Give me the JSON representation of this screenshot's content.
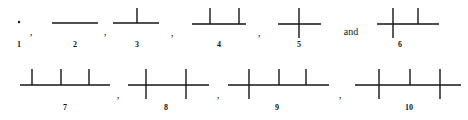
{
  "figure": {
    "caption": "",
    "stroke_color": "#151515",
    "background_color": "#ffffff",
    "width": 468,
    "height": 120
  },
  "diagram_items": [
    {
      "id": "figure-1",
      "label": "1",
      "label_x": 19,
      "label_y": 41,
      "kind": "point",
      "baseline_y": 23,
      "baseline_x1": 18,
      "baseline_x2": 20,
      "nodes": [],
      "dot": {
        "cx": 19,
        "cy": 22,
        "r": 1.2
      }
    },
    {
      "id": "figure-2",
      "label": "2",
      "label_x": 75,
      "label_y": 41,
      "kind": "segment",
      "baseline_y": 23,
      "baseline_x1": 52,
      "baseline_x2": 98,
      "nodes": []
    },
    {
      "id": "figure-3",
      "label": "3",
      "label_x": 137,
      "label_y": 41,
      "kind": "segment-with-ticks",
      "baseline_y": 23,
      "baseline_x1": 113,
      "baseline_x2": 159,
      "nodes": [
        {
          "x": 137,
          "up": 15,
          "down": 0
        }
      ]
    },
    {
      "id": "figure-4",
      "label": "4",
      "label_x": 219,
      "label_y": 41,
      "kind": "segment-with-ticks",
      "baseline_y": 24,
      "baseline_x1": 192,
      "baseline_x2": 246,
      "nodes": [
        {
          "x": 210,
          "up": 16,
          "down": 0
        },
        {
          "x": 239,
          "up": 16,
          "down": 0
        }
      ]
    },
    {
      "id": "figure-5",
      "label": "5",
      "label_x": 299,
      "label_y": 41,
      "kind": "segment-with-ticks",
      "baseline_y": 24,
      "baseline_x1": 278,
      "baseline_x2": 321,
      "nodes": [
        {
          "x": 299,
          "up": 16,
          "down": 14
        }
      ]
    },
    {
      "id": "figure-6",
      "label": "6",
      "label_x": 400,
      "label_y": 41,
      "kind": "segment-with-ticks",
      "baseline_y": 24,
      "baseline_x1": 377,
      "baseline_x2": 439,
      "nodes": [
        {
          "x": 393,
          "up": 16,
          "down": 14
        },
        {
          "x": 418,
          "up": 16,
          "down": 0
        }
      ]
    },
    {
      "id": "figure-7",
      "label": "7",
      "label_x": 65,
      "label_y": 104,
      "kind": "segment-with-ticks",
      "baseline_y": 85,
      "baseline_x1": 20,
      "baseline_x2": 110,
      "nodes": [
        {
          "x": 32,
          "up": 16,
          "down": 0
        },
        {
          "x": 61,
          "up": 16,
          "down": 0
        },
        {
          "x": 89,
          "up": 16,
          "down": 0
        }
      ]
    },
    {
      "id": "figure-8",
      "label": "8",
      "label_x": 166,
      "label_y": 104,
      "kind": "segment-with-ticks",
      "baseline_y": 85,
      "baseline_x1": 128,
      "baseline_x2": 209,
      "nodes": [
        {
          "x": 146,
          "up": 16,
          "down": 14
        },
        {
          "x": 186,
          "up": 16,
          "down": 14
        }
      ]
    },
    {
      "id": "figure-9",
      "label": "9",
      "label_x": 277,
      "label_y": 104,
      "kind": "segment-with-ticks",
      "baseline_y": 85,
      "baseline_x1": 228,
      "baseline_x2": 329,
      "nodes": [
        {
          "x": 249,
          "up": 16,
          "down": 14
        },
        {
          "x": 279,
          "up": 16,
          "down": 0
        },
        {
          "x": 306,
          "up": 16,
          "down": 0
        }
      ]
    },
    {
      "id": "figure-10",
      "label": "10",
      "label_x": 409,
      "label_y": 104,
      "kind": "segment-with-ticks",
      "baseline_y": 85,
      "baseline_x1": 355,
      "baseline_x2": 461,
      "nodes": [
        {
          "x": 379,
          "up": 16,
          "down": 14
        },
        {
          "x": 410,
          "up": 16,
          "down": 0
        },
        {
          "x": 440,
          "up": 16,
          "down": 14
        }
      ]
    }
  ],
  "separators": [
    {
      "id": "sep-1-2",
      "text": ",",
      "x": 31,
      "y": 26
    },
    {
      "id": "sep-2-3",
      "text": ",",
      "x": 105,
      "y": 26
    },
    {
      "id": "sep-3-4",
      "text": ",",
      "x": 172,
      "y": 27
    },
    {
      "id": "sep-4-5",
      "text": ",",
      "x": 259,
      "y": 27
    },
    {
      "id": "sep-7-8",
      "text": ",",
      "x": 118,
      "y": 89
    },
    {
      "id": "sep-8-9",
      "text": ",",
      "x": 218,
      "y": 89
    },
    {
      "id": "sep-9-10",
      "text": ",",
      "x": 340,
      "y": 89
    }
  ],
  "conjunctions": [
    {
      "id": "conj-and",
      "text": "and",
      "x": 351,
      "y": 27
    }
  ]
}
